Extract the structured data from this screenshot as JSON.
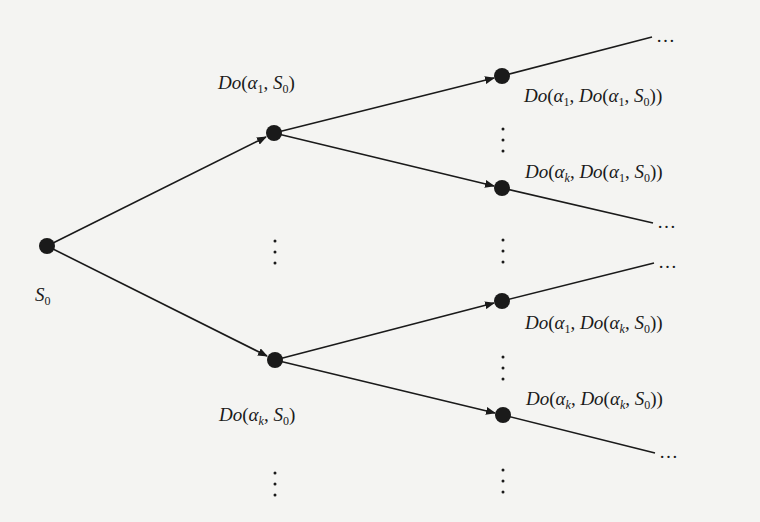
{
  "diagram": {
    "type": "situation-tree",
    "colors": {
      "background": "#f4f4f2",
      "ink": "#1a1a1a"
    },
    "nodes": [
      {
        "id": "s0",
        "x": 47,
        "y": 246,
        "label": {
          "fn": "",
          "parts": [
            "S",
            "0"
          ],
          "text": "S0"
        }
      },
      {
        "id": "do-a1-s0",
        "x": 274,
        "y": 133,
        "label": {
          "text": "Do(α1, S0)"
        }
      },
      {
        "id": "do-ak-s0",
        "x": 275,
        "y": 360,
        "label": {
          "text": "Do(αk, S0)"
        }
      },
      {
        "id": "do-a1-do-a1-s0",
        "x": 502,
        "y": 76,
        "label": {
          "text": "Do(α1, Do(α1, S0))"
        }
      },
      {
        "id": "do-ak-do-a1-s0",
        "x": 502,
        "y": 188,
        "label": {
          "text": "Do(αk, Do(α1, S0))"
        }
      },
      {
        "id": "do-a1-do-ak-s0",
        "x": 502,
        "y": 301,
        "label": {
          "text": "Do(α1, Do(αk, S0))"
        }
      },
      {
        "id": "do-ak-do-ak-s0",
        "x": 503,
        "y": 415,
        "label": {
          "text": "Do(αk, Do(αk, S0))"
        }
      }
    ],
    "edges": [
      {
        "from": "s0",
        "to": "do-a1-s0",
        "arrow": true
      },
      {
        "from": "s0",
        "to": "do-ak-s0",
        "arrow": true
      },
      {
        "from": "do-a1-s0",
        "to": "do-a1-do-a1-s0",
        "arrow": true
      },
      {
        "from": "do-a1-s0",
        "to": "do-ak-do-a1-s0",
        "arrow": true
      },
      {
        "from": "do-ak-s0",
        "to": "do-a1-do-ak-s0",
        "arrow": true
      },
      {
        "from": "do-ak-s0",
        "to": "do-ak-do-ak-s0",
        "arrow": true
      }
    ],
    "continuations": [
      {
        "from": "do-a1-do-a1-s0",
        "to": [
          652,
          37
        ],
        "text": "…"
      },
      {
        "from": "do-ak-do-a1-s0",
        "to": [
          653,
          223
        ],
        "text": "…"
      },
      {
        "from": "do-a1-do-ak-s0",
        "to": [
          654,
          263
        ],
        "text": "…"
      },
      {
        "from": "do-ak-do-ak-s0",
        "to": [
          655,
          453
        ],
        "text": "…"
      }
    ],
    "vertical_ellipses": [
      {
        "x": 275,
        "y": 246
      },
      {
        "x": 275,
        "y": 480
      },
      {
        "x": 503,
        "y": 145
      },
      {
        "x": 503,
        "y": 248
      },
      {
        "x": 503,
        "y": 357
      },
      {
        "x": 503,
        "y": 476
      }
    ],
    "labels": {
      "s0": {
        "base": "S",
        "sub": "0"
      },
      "do_a1_s0": {
        "fn": "Do",
        "a": "α",
        "a_sub": "1",
        "s": "S",
        "s_sub": "0"
      },
      "do_ak_s0": {
        "fn": "Do",
        "a": "α",
        "a_sub": "k",
        "s": "S",
        "s_sub": "0"
      },
      "do_a1_do_a1_s0": {
        "fn": "Do",
        "a": "α",
        "a_sub": "1",
        "inner_fn": "Do",
        "b": "α",
        "b_sub": "1",
        "s": "S",
        "s_sub": "0"
      },
      "do_ak_do_a1_s0": {
        "fn": "Do",
        "a": "α",
        "a_sub": "k",
        "inner_fn": "Do",
        "b": "α",
        "b_sub": "1",
        "s": "S",
        "s_sub": "0"
      },
      "do_a1_do_ak_s0": {
        "fn": "Do",
        "a": "α",
        "a_sub": "1",
        "inner_fn": "Do",
        "b": "α",
        "b_sub": "k",
        "s": "S",
        "s_sub": "0"
      },
      "do_ak_do_ak_s0": {
        "fn": "Do",
        "a": "α",
        "a_sub": "k",
        "inner_fn": "Do",
        "b": "α",
        "b_sub": "k",
        "s": "S",
        "s_sub": "0"
      }
    },
    "ellipsis_text": "…",
    "punct": {
      "open": "(",
      "close": ")",
      "comma": ", "
    }
  }
}
